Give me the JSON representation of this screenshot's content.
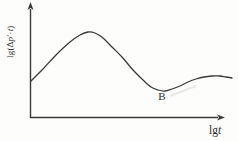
{
  "figure": {
    "background_color": "#fdfdfc",
    "line_color": "#3a3a3a",
    "text_color": "#2e2e2e"
  },
  "chart_data": {
    "type": "line",
    "title": "",
    "xlabel": "lgt",
    "xlabel_parts": [
      "lg",
      "t"
    ],
    "ylabel": "lg(Δp′·t)",
    "ylabel_parts": [
      "lg(Δ",
      "p",
      "′·",
      "t",
      ")"
    ],
    "axes": {
      "x_ticks": [],
      "y_ticks": [],
      "grid": false
    },
    "series": [
      {
        "name": "log-log pressure-derivative curve",
        "points_px": [
          [
            31,
            81
          ],
          [
            42,
            70
          ],
          [
            56,
            55
          ],
          [
            70,
            42
          ],
          [
            80,
            35
          ],
          [
            88,
            32
          ],
          [
            95,
            33
          ],
          [
            103,
            38
          ],
          [
            112,
            47
          ],
          [
            122,
            57
          ],
          [
            133,
            70
          ],
          [
            143,
            80
          ],
          [
            151,
            87
          ],
          [
            158,
            90
          ],
          [
            165,
            91
          ],
          [
            172,
            89
          ],
          [
            180,
            86
          ],
          [
            188,
            82
          ],
          [
            196,
            79
          ],
          [
            204,
            77
          ],
          [
            212,
            76
          ],
          [
            220,
            76
          ],
          [
            226,
            77
          ],
          [
            232,
            78
          ]
        ]
      }
    ],
    "annotations": [
      {
        "label": "B",
        "x_px": 162,
        "y_px": 100
      }
    ]
  }
}
